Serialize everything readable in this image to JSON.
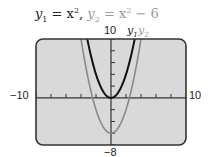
{
  "title": {
    "y1_name": "y",
    "y1_sub": "1",
    "y1_expr_lhs": "= x",
    "y1_exp": "2",
    "separator": ",",
    "y2_name": "y",
    "y2_sub": "2",
    "y2_expr": "= x",
    "y2_exp": "2",
    "y2_tail": " − 6"
  },
  "labels": {
    "xmin": "−10",
    "xmax": "10",
    "ymax": "10",
    "ymin": "−8",
    "curve1": "y",
    "curve1_sub": "1",
    "curve2": "y",
    "curve2_sub": "2"
  },
  "colors": {
    "background": "#d9d9d9",
    "frame": "#333333",
    "axis": "#333333",
    "y1": "#111111",
    "y2": "#888888"
  },
  "chart_data": {
    "type": "line",
    "xlabel": "",
    "ylabel": "",
    "xlim": [
      -10,
      10
    ],
    "ylim": [
      -8,
      10
    ],
    "xscale": 2,
    "yscale": 2,
    "grid": false,
    "legend": [
      "y1",
      "y2"
    ],
    "series": [
      {
        "name": "y1",
        "expression": "x^2",
        "x": [
          -3.16,
          -3,
          -2,
          -1,
          0,
          1,
          2,
          3,
          3.16
        ],
        "y": [
          10,
          9,
          4,
          1,
          0,
          1,
          4,
          9,
          10
        ]
      },
      {
        "name": "y2",
        "expression": "x^2 - 6",
        "x": [
          -4,
          -3,
          -2,
          -1,
          0,
          1,
          2,
          3,
          4
        ],
        "y": [
          10,
          3,
          -2,
          -5,
          -6,
          -5,
          -2,
          3,
          10
        ]
      }
    ]
  }
}
